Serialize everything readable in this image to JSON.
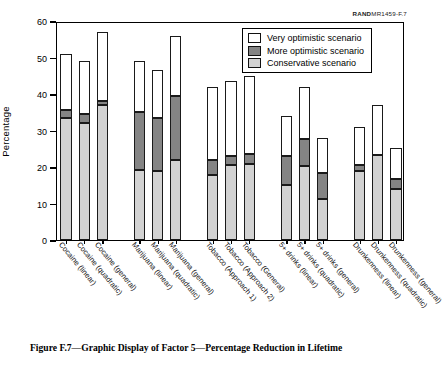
{
  "figure": {
    "rand_id_bold": "RAND",
    "rand_id_rest": "MR1459-F.7",
    "caption": "Figure F.7—Graphic Display of Factor 5—Percentage Reduction in Lifetime"
  },
  "legend": {
    "items": [
      {
        "label": "Very optimistic scenario",
        "color": "#ffffff"
      },
      {
        "label": "More optimistic scenario",
        "color": "#848484"
      },
      {
        "label": "Conservative scenario",
        "color": "#d2d2d2"
      }
    ]
  },
  "chart_data": {
    "type": "bar",
    "subtype": "stacked-vertical",
    "title": "",
    "xlabel": "",
    "ylabel": "Percentage",
    "ylim": [
      0,
      60
    ],
    "yticks": [
      0,
      10,
      20,
      30,
      40,
      50,
      60
    ],
    "grid": false,
    "legend_position": "top-right",
    "categories": [
      "Cocaine (linear)",
      "Cocaine (quadratic)",
      "Cocaine (general)",
      "Marijuana (linear)",
      "Marijuana (quadratic)",
      "Marijuana (general)",
      "Tobacco (Approach 1)",
      "Tobacco (Approach 2)",
      "Tobacco (General)",
      "5+ drinks (linear)",
      "5+ drinks (quadratic)",
      "5+ drinks (general)",
      "Drunkenness (linear)",
      "Drunkenness (quadratic)",
      "Drunkenness (general)"
    ],
    "group_gaps_after": [
      2,
      5,
      8,
      11
    ],
    "series": [
      {
        "name": "Conservative scenario",
        "color": "#d2d2d2",
        "values": [
          33.5,
          32.0,
          37.0,
          19.3,
          18.8,
          22.0,
          17.8,
          20.5,
          20.8,
          15.0,
          20.4,
          11.3,
          18.8,
          23.2,
          14.0
        ]
      },
      {
        "name": "More optimistic scenario",
        "color": "#848484",
        "values": [
          2.0,
          2.5,
          1.0,
          15.7,
          14.7,
          17.5,
          4.2,
          2.5,
          2.7,
          8.0,
          7.3,
          7.1,
          1.8,
          0.0,
          2.8
        ]
      },
      {
        "name": "Very optimistic scenario",
        "color": "#ffffff",
        "values": [
          15.5,
          14.5,
          19.0,
          14.0,
          14.0,
          16.5,
          19.8,
          20.5,
          21.5,
          11.0,
          14.3,
          9.6,
          10.4,
          13.8,
          8.5
        ]
      }
    ],
    "cumulative_tops": {
      "conservative": [
        33.5,
        32.0,
        37.0,
        19.3,
        18.8,
        22.0,
        17.8,
        20.5,
        20.8,
        15.0,
        20.4,
        11.3,
        18.8,
        23.2,
        14.0
      ],
      "more_optimistic": [
        35.5,
        34.5,
        38.0,
        35.0,
        33.5,
        39.5,
        22.0,
        23.0,
        23.5,
        23.0,
        27.7,
        18.4,
        20.6,
        23.2,
        16.8
      ],
      "very_optimistic": [
        51.0,
        49.0,
        57.0,
        49.0,
        46.5,
        56.0,
        41.8,
        43.5,
        45.0,
        34.0,
        42.0,
        28.0,
        31.0,
        37.0,
        25.3
      ]
    }
  }
}
